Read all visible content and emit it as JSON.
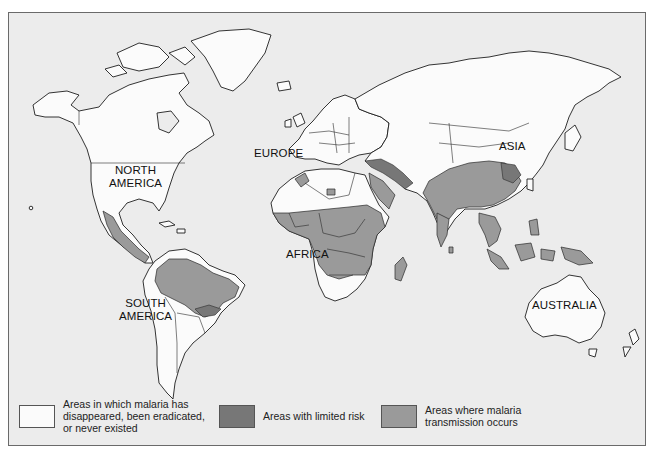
{
  "map": {
    "title": "",
    "region_labels": {
      "north_america": [
        "NORTH",
        "AMERICA"
      ],
      "south_america": [
        "SOUTH",
        "AMERICA"
      ],
      "europe": "EUROPE",
      "africa": "AFRICA",
      "asia": "ASIA",
      "australia": "AUSTRALIA"
    }
  },
  "legend": [
    {
      "key": "none",
      "lines": [
        "Areas in which malaria has",
        "disappeared, been eradicated,",
        "or never existed"
      ],
      "color": "#fbfbfb"
    },
    {
      "key": "limited",
      "lines": [
        "Areas with limited risk"
      ],
      "color": "#777777"
    },
    {
      "key": "transmission",
      "lines": [
        "Areas where malaria",
        "transmission occurs"
      ],
      "color": "#9a9a9a"
    }
  ],
  "colors": {
    "ocean": "#ececec",
    "frame_border": "#6a6a6a"
  }
}
